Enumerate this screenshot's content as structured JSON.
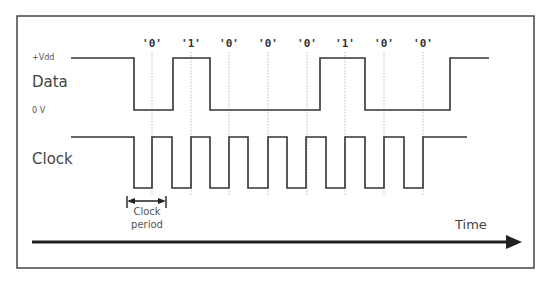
{
  "diagram": {
    "data_signal": {
      "label": "Data",
      "high_label": "+Vdd",
      "low_label": "0 V",
      "bits": [
        "'0'",
        "'1'",
        "'0'",
        "'0'",
        "'0'",
        "'1'",
        "'0'",
        "'0'"
      ]
    },
    "clock_signal": {
      "label": "Clock"
    },
    "clock_period_annotation": {
      "line1": "Clock",
      "line2": "period"
    },
    "time_axis": {
      "label": "Time"
    },
    "colors": {
      "line": "#333333",
      "frame": "#444444",
      "guide": "#aaaaaa",
      "text": "#444444"
    }
  }
}
